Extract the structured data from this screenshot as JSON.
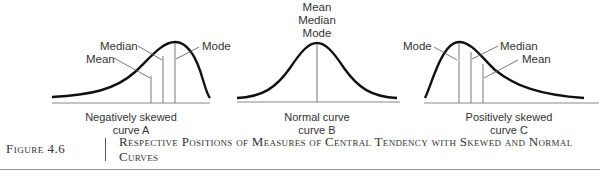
{
  "figure": {
    "number": "Figure 4.6",
    "title": "Respective Positions of Measures of Central Tendency with Skewed and Normal Curves"
  },
  "curves": [
    {
      "id": "A",
      "caption_line1": "Negatively skewed",
      "caption_line2": "curve A",
      "labels": {
        "median": "Median",
        "mean": "Mean",
        "mode": "Mode"
      }
    },
    {
      "id": "B",
      "caption_line1": "Normal curve",
      "caption_line2": "curve B",
      "labels": {
        "mean": "Mean",
        "median": "Median",
        "mode": "Mode"
      }
    },
    {
      "id": "C",
      "caption_line1": "Positively skewed",
      "caption_line2": "curve C",
      "labels": {
        "mode": "Mode",
        "median": "Median",
        "mean": "Mean"
      }
    }
  ],
  "colors": {
    "curve": "#111111",
    "line": "#555555",
    "text": "#333333"
  }
}
